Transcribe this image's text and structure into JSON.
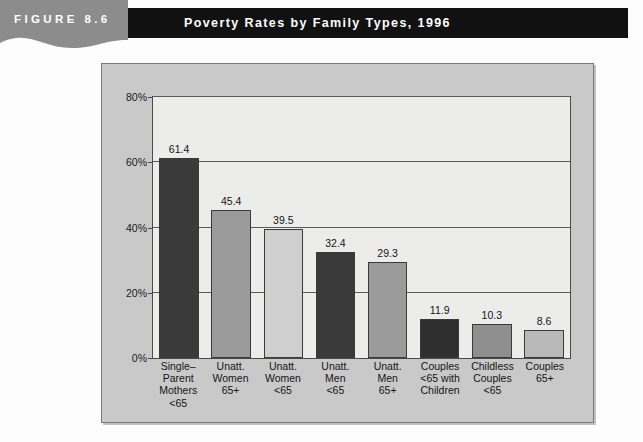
{
  "figure": {
    "tab_label": "FIGURE 8.6",
    "title": "Poverty Rates by Family Types, 1996",
    "tab_color": "#8c8c8c",
    "title_bar_color": "#111111"
  },
  "panel": {
    "background_color": "#c9c9c9",
    "plot_background_color": "#ececeb",
    "border_color": "#4b4b4b"
  },
  "chart_data": {
    "type": "bar",
    "title": "Poverty Rates by Family Types, 1996",
    "xlabel": "",
    "ylabel": "",
    "ylim": [
      0,
      80
    ],
    "yticks": [
      0,
      20,
      40,
      60,
      80
    ],
    "ytick_labels": [
      "0%",
      "20%",
      "40%",
      "60%",
      "80%"
    ],
    "grid": true,
    "legend": "none",
    "categories": [
      "Single–Parent Mothers <65",
      "Unatt. Women 65+",
      "Unatt. Women <65",
      "Unatt. Men <65",
      "Unatt. Men 65+",
      "Couples <65 with Children",
      "Childless Couples <65",
      "Couples 65+"
    ],
    "category_lines": [
      [
        "Single–",
        "Parent",
        "Mothers",
        "<65"
      ],
      [
        "Unatt.",
        "Women",
        "65+"
      ],
      [
        "Unatt.",
        "Women",
        "<65"
      ],
      [
        "Unatt.",
        "Men",
        "<65"
      ],
      [
        "Unatt.",
        "Men",
        "65+"
      ],
      [
        "Couples",
        "<65 with",
        "Children"
      ],
      [
        "Childless",
        "Couples",
        "<65"
      ],
      [
        "Couples",
        "65+"
      ]
    ],
    "values": [
      61.4,
      45.4,
      39.5,
      32.4,
      29.3,
      11.9,
      10.3,
      8.6
    ],
    "value_labels": [
      "61.4",
      "45.4",
      "39.5",
      "32.4",
      "29.3",
      "11.9",
      "10.3",
      "8.6"
    ],
    "bar_colors": [
      "#3a3a3a",
      "#9b9b9b",
      "#cfcfcf",
      "#3a3a3a",
      "#9b9b9b",
      "#2f2f2f",
      "#8f8f8f",
      "#b9b9b9"
    ]
  }
}
